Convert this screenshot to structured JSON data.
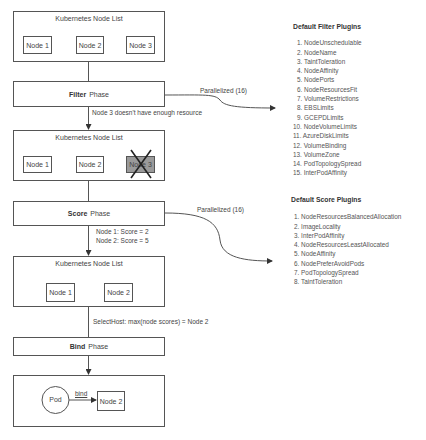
{
  "flow": {
    "node_list_1": {
      "title": "Kubernetes Node List",
      "nodes": [
        "Node 1",
        "Node 2",
        "Node 3"
      ]
    },
    "filter_phase": {
      "bold": "Filter",
      "rest": "Phase"
    },
    "filter_parallel_label": "Parallelized (16)",
    "filter_result": "Node 3 doesn't have enough resource",
    "node_list_2": {
      "title": "Kubernetes Node List",
      "nodes": [
        "Node 1",
        "Node 2",
        "Node 3"
      ],
      "eliminated": "Node 3"
    },
    "score_phase": {
      "bold": "Score",
      "rest": "Phase"
    },
    "score_parallel_label": "Parallelized (16)",
    "score_results": [
      "Node 1: Score = 2",
      "Node 2: Score = 5"
    ],
    "node_list_3": {
      "title": "Kubernetes Node List",
      "nodes": [
        "Node 1",
        "Node 2"
      ]
    },
    "select_host": "SelectHost:  max(node scores) = Node 2",
    "bind_phase": {
      "bold": "Bind",
      "rest": "Phase"
    },
    "bind_box": {
      "pod": "Pod",
      "edge_label": "bind",
      "node": "Node 2"
    }
  },
  "filter_plugins": {
    "title": "Default Filter Plugins",
    "items": [
      "1. NodeUnschedulable",
      "2. NodeName",
      "3. TaintToleration",
      "4. NodeAffinity",
      "5. NodePorts",
      "6. NodeResourcesFit",
      "7. VolumeRestrictions",
      "8. EBSLimits",
      "9. GCEPDLimits",
      "10. NodeVolumeLimits",
      "11. AzureDiskLimits",
      "12. VolumeBinding",
      "13. VolumeZone",
      "14. PodTopologySpread",
      "15. InterPodAffinity"
    ]
  },
  "score_plugins": {
    "title": "Default Score Plugins",
    "items": [
      "1. NodeResourcesBalancedAllocation",
      "2. ImageLocality",
      "3. InterPodAffinity",
      "4. NodeResourcesLeastAllocated",
      "5. NodeAffinity",
      "6. NodePreferAvoidPods",
      "7. PodTopologySpread",
      "8. TaintToleration"
    ]
  }
}
